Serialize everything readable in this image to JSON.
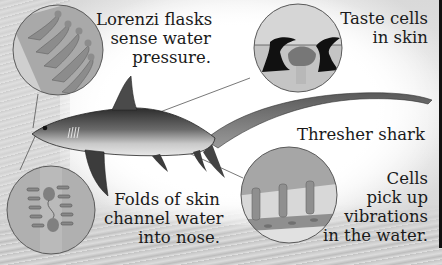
{
  "diagram": {
    "subject": "Thresher shark",
    "labels": {
      "lorenzi": "Lorenzi flasks\nsense water\npressure.",
      "taste": "Taste cells\nin skin",
      "species": "Thresher shark",
      "folds": "Folds of skin\nchannel water\ninto nose.",
      "cells": "Cells\npick up\nvibrations\nin the water."
    },
    "insets": [
      {
        "id": "lorenzi-flasks",
        "caption": "Lorenzi flasks sense water pressure."
      },
      {
        "id": "taste-cells",
        "caption": "Taste cells in skin"
      },
      {
        "id": "nose-folds",
        "caption": "Folds of skin channel water into nose."
      },
      {
        "id": "lateral-line",
        "caption": "Cells pick up vibrations in the water."
      }
    ],
    "colors": {
      "inset_fill": "#b3b3b3",
      "inset_stroke": "#5a5a5a",
      "shark_dark": "#3a3a3a",
      "shark_light": "#c8c8c8",
      "text": "#1a1a1a",
      "edge_bar": "#111111"
    }
  }
}
